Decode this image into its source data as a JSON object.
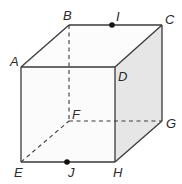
{
  "diagram": {
    "type": "cube",
    "colors": {
      "edge": "#3a3a3a",
      "front_face": "#fbfbfb",
      "top_face": "#fcfcfc",
      "right_face": "#e6e6e6",
      "point": "#111111",
      "label": "#2a2a2a"
    },
    "vertices": {
      "A": {
        "label": "A",
        "x": 21,
        "y": 67
      },
      "B": {
        "label": "B",
        "x": 69,
        "y": 25
      },
      "C": {
        "label": "C",
        "x": 162,
        "y": 25
      },
      "D": {
        "label": "D",
        "x": 115,
        "y": 67
      },
      "E": {
        "label": "E",
        "x": 21,
        "y": 162
      },
      "F": {
        "label": "F",
        "x": 69,
        "y": 121
      },
      "G": {
        "label": "G",
        "x": 162,
        "y": 121
      },
      "H": {
        "label": "H",
        "x": 115,
        "y": 162
      }
    },
    "points": {
      "I": {
        "label": "I",
        "x": 112,
        "y": 25,
        "on_edge": "BC"
      },
      "J": {
        "label": "J",
        "x": 67,
        "y": 162,
        "on_edge": "EH"
      }
    },
    "hidden_edges": [
      "BF",
      "EF",
      "FG"
    ],
    "visible_edges": [
      "AB",
      "BC",
      "CD",
      "AD",
      "AE",
      "EH",
      "DH",
      "CG",
      "GH"
    ]
  }
}
